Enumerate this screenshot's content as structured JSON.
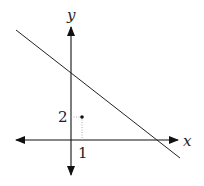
{
  "diagram": {
    "axes": {
      "x_label": "x",
      "y_label": "y"
    },
    "point": {
      "x_tick_label": "1",
      "y_tick_label": "2",
      "coordinates": [
        1,
        2
      ]
    },
    "line": {
      "description": "line with negative slope crossing positive y-axis and positive x-axis"
    }
  }
}
